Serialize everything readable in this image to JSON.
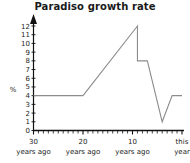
{
  "chart_data": {
    "type": "line",
    "title": "Paradiso growth rate",
    "xlabel": "",
    "ylabel": "%",
    "ylim": [
      0,
      12
    ],
    "xlim": [
      30,
      0
    ],
    "grid": false,
    "legend": null,
    "y_ticks": [
      "0",
      "1",
      "2",
      "3",
      "4",
      "5",
      "6",
      "7",
      "8",
      "9",
      "10",
      "11",
      "12"
    ],
    "x_tick_labels": [
      {
        "value": 30,
        "line1": "30",
        "line2": "years ago"
      },
      {
        "value": 20,
        "line1": "20",
        "line2": "years ago"
      },
      {
        "value": 10,
        "line1": "10",
        "line2": "years ago"
      },
      {
        "value": 0,
        "line1": "this",
        "line2": "year"
      }
    ],
    "x_minor_tick_count": 30,
    "series": [
      {
        "name": "growth rate",
        "color": "#8c8c8c",
        "x": [
          30,
          20,
          9,
          9,
          7,
          4,
          2,
          0
        ],
        "values": [
          4,
          4,
          12,
          8,
          8,
          1,
          4,
          4
        ]
      }
    ]
  },
  "axes": {
    "y_axis_arrow": "arrow-up-icon",
    "x_axis_name": "x-axis",
    "y_axis_name": "y-axis"
  }
}
